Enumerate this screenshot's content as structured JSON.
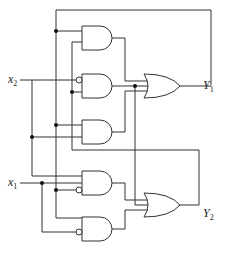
{
  "diagram": {
    "type": "logic-circuit",
    "inputs": [
      {
        "id": "x2",
        "label": "x",
        "sub": "2"
      },
      {
        "id": "x1",
        "label": "x",
        "sub": "1"
      }
    ],
    "outputs": [
      {
        "id": "Y1",
        "label": "Y",
        "sub": "1"
      },
      {
        "id": "Y2",
        "label": "Y",
        "sub": "2"
      }
    ],
    "gates": [
      {
        "id": "and1",
        "type": "AND",
        "inputs": [
          "Y1",
          "Y2"
        ],
        "output_to": "or1"
      },
      {
        "id": "and2",
        "type": "AND",
        "inputs": [
          "NOT x2",
          "Y2"
        ],
        "output_to": "or1"
      },
      {
        "id": "and3",
        "type": "AND",
        "inputs": [
          "Y1",
          "x2"
        ],
        "output_to": "or1"
      },
      {
        "id": "and4",
        "type": "AND",
        "inputs": [
          "x2",
          "x1",
          "NOT Y1"
        ],
        "output_to": "or2"
      },
      {
        "id": "and5",
        "type": "AND",
        "inputs": [
          "Y1",
          "NOT x1"
        ],
        "output_to": "or2"
      },
      {
        "id": "or1",
        "type": "OR",
        "output": "Y1"
      },
      {
        "id": "or2",
        "type": "OR",
        "output": "Y2"
      }
    ]
  }
}
